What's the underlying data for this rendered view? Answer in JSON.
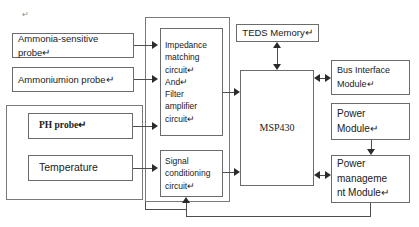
{
  "diagram": {
    "stray_mark": "↵",
    "nodes": {
      "ammonia_probe": {
        "label": "Ammonia-sensitive probe↵"
      },
      "ammonium_probe": {
        "label": "Ammoniumion probe↵"
      },
      "ph_probe": {
        "label": "PH probe↵"
      },
      "temperature_probe": {
        "label": "Temperature"
      },
      "impedance_block": {
        "label": "Impedance\nmatching\ncircuit↵\nAnd↵\nFilter\namplifier\ncircuit↵"
      },
      "signal_conditioning": {
        "label": "Signal\nconditioning\ncircuit↵"
      },
      "teds_memory": {
        "label": "TEDS Memory↵"
      },
      "mcu": {
        "label": "MSP430"
      },
      "bus_interface": {
        "label": "Bus  Interface\nModule↵"
      },
      "power_module": {
        "label": "Power\nModule↵"
      },
      "power_management": {
        "label": "Power\nmanageme\nnt Module↵"
      }
    },
    "colors": {
      "box_border": "#6b6b6b",
      "line": "#4d4d4d",
      "arrow": "#2b2b2b",
      "text": "#1a1a1a",
      "background": "#ffffff"
    }
  }
}
